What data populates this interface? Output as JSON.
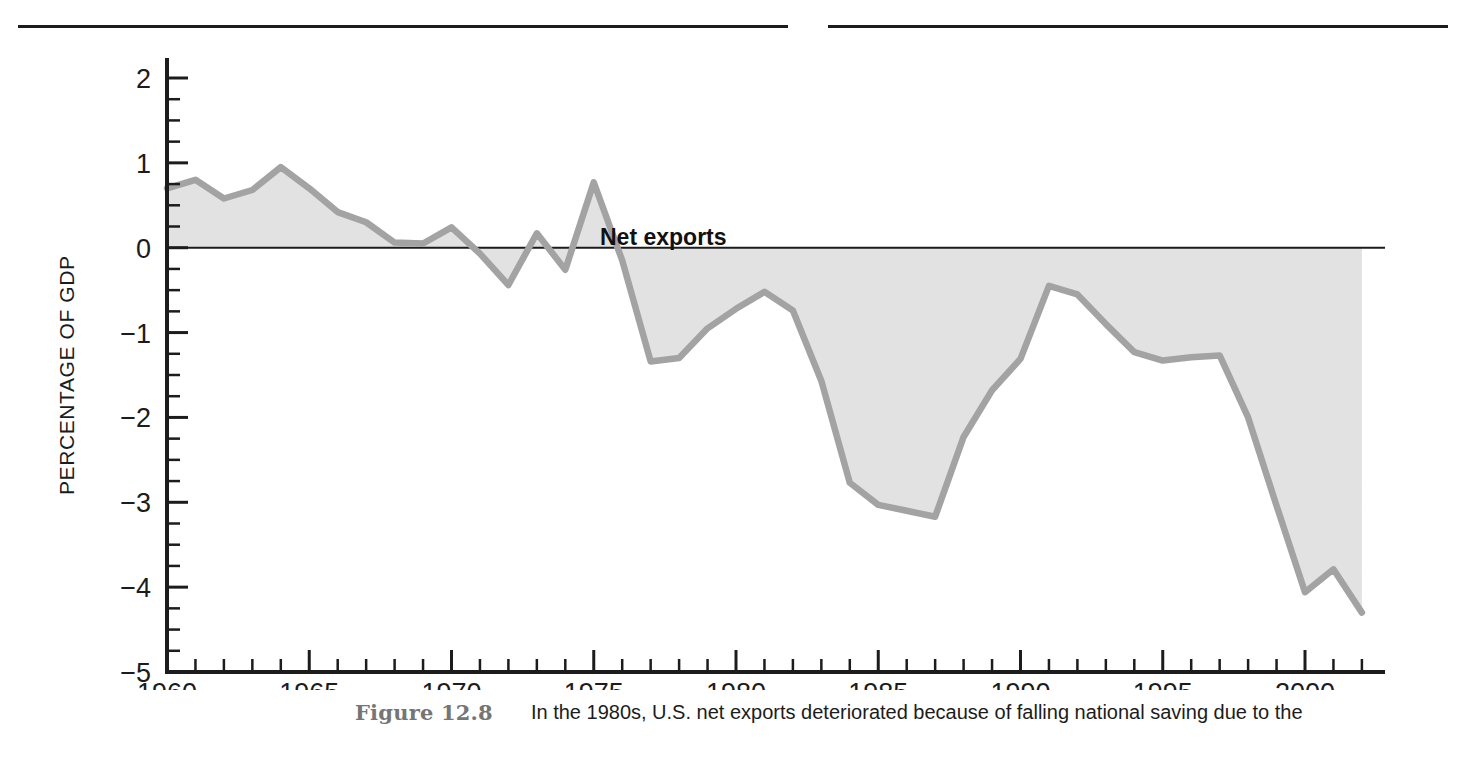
{
  "figure": {
    "caption_label": "Figure 12.8",
    "caption_text": "In the 1980s, U.S. net exports deteriorated because of falling national saving due to the"
  },
  "chart_data": {
    "type": "area",
    "title": "",
    "subtitle": "",
    "xlabel": "",
    "ylabel": "PERCENTAGE OF GDP",
    "series_label": "Net exports",
    "xlim": [
      1960,
      2002
    ],
    "ylim": [
      -5,
      2
    ],
    "y_ticks": [
      "2",
      "1",
      "0",
      "−1",
      "−2",
      "−3",
      "−4",
      "−5"
    ],
    "y_tick_values": [
      2,
      1,
      0,
      -1,
      -2,
      -3,
      -4,
      -5
    ],
    "y_minor_step": 0.25,
    "x_ticks": [
      "1960",
      "1965",
      "1970",
      "1975",
      "1980",
      "1985",
      "1990",
      "1995",
      "2000"
    ],
    "x_tick_values": [
      1960,
      1965,
      1970,
      1975,
      1980,
      1985,
      1990,
      1995,
      2000
    ],
    "x_minor_step": 1,
    "grid": false,
    "legend": "inline-annotation",
    "legend_position": "inside-top-center",
    "zero_line": true,
    "fill_color": "#e2e2e2",
    "line_color": "#a3a3a3",
    "axis_color": "#1c1c1c",
    "x": [
      1960,
      1961,
      1962,
      1963,
      1964,
      1965,
      1966,
      1967,
      1968,
      1969,
      1970,
      1971,
      1972,
      1973,
      1974,
      1975,
      1976,
      1977,
      1978,
      1979,
      1980,
      1981,
      1982,
      1983,
      1984,
      1985,
      1986,
      1987,
      1988,
      1989,
      1990,
      1991,
      1992,
      1993,
      1994,
      1995,
      1996,
      1997,
      1998,
      1999,
      2000,
      2001,
      2002
    ],
    "values": [
      0.7,
      0.8,
      0.58,
      0.68,
      0.95,
      0.7,
      0.42,
      0.3,
      0.06,
      0.05,
      0.24,
      -0.07,
      -0.44,
      0.17,
      -0.26,
      0.77,
      -0.15,
      -1.34,
      -1.3,
      -0.95,
      -0.72,
      -0.52,
      -0.74,
      -1.57,
      -2.77,
      -3.03,
      -3.1,
      -3.17,
      -2.23,
      -1.68,
      -1.31,
      -0.45,
      -0.55,
      -0.9,
      -1.23,
      -1.33,
      -1.29,
      -1.27,
      -2.0,
      -3.04,
      -4.06,
      -3.79,
      -4.3
    ]
  }
}
